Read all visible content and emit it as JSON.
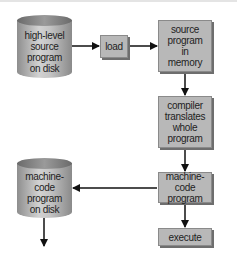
{
  "diagram": {
    "nodes": {
      "source_disk": {
        "label": "high-level\nsource\nprogram\non disk",
        "shape": "cylinder"
      },
      "load": {
        "label": "load",
        "shape": "box"
      },
      "source_memory": {
        "label": "source\nprogram\nin\nmemory",
        "shape": "box"
      },
      "compiler": {
        "label": "compiler\ntranslates\nwhole\nprogram",
        "shape": "box"
      },
      "machine_code": {
        "label": "machine-code\nprogram",
        "shape": "box"
      },
      "execute": {
        "label": "execute",
        "shape": "box"
      },
      "machine_disk": {
        "label": "machine-\ncode\nprogram\non disk",
        "shape": "cylinder"
      }
    },
    "edges": [
      {
        "from": "source_disk",
        "to": "load"
      },
      {
        "from": "load",
        "to": "source_memory"
      },
      {
        "from": "source_memory",
        "to": "compiler"
      },
      {
        "from": "compiler",
        "to": "machine_code"
      },
      {
        "from": "machine_code",
        "to": "execute"
      },
      {
        "from": "machine_code",
        "to": "machine_disk"
      },
      {
        "from": "machine_disk",
        "to": "(continues below)"
      }
    ],
    "colors": {
      "box_fill": "#b8b8b8",
      "arrow": "#111111"
    }
  }
}
